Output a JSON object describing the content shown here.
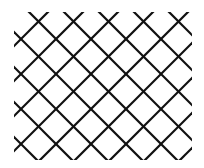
{
  "diagram": {
    "background": "#ffffff",
    "stroke_color": "#111111",
    "stroke_width": 2.2,
    "clip": {
      "x": 14,
      "y": 12,
      "width": 178,
      "height": 148
    },
    "slash_lines_sum": [
      60,
      95,
      130,
      165,
      200,
      235,
      270,
      305,
      340
    ],
    "backslash_lines_diff": [
      -123,
      -88,
      -53,
      -18,
      17,
      52,
      87,
      122,
      157
    ]
  }
}
